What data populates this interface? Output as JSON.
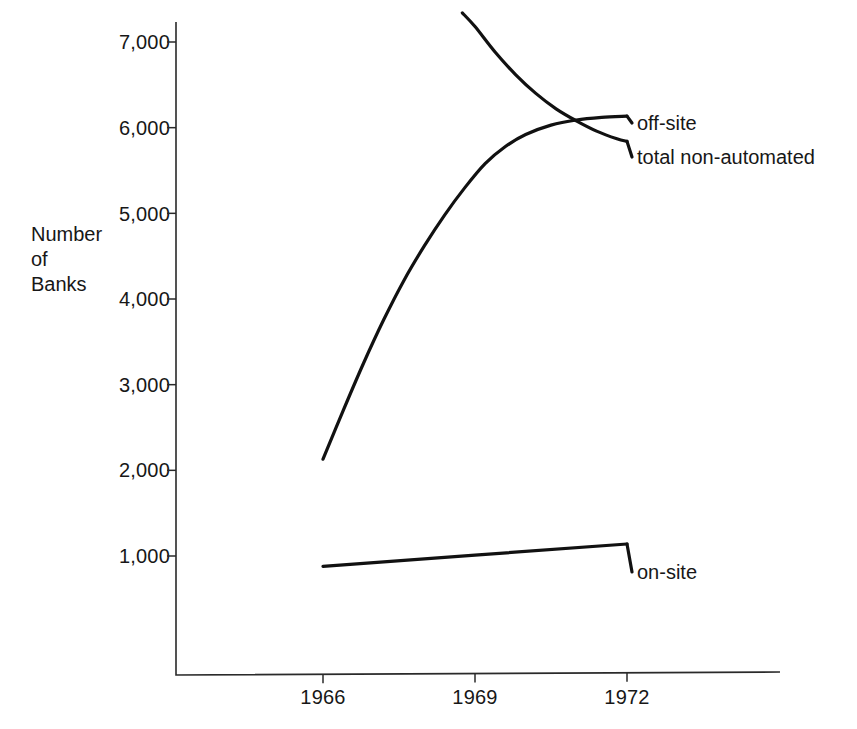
{
  "chart_data": {
    "type": "line",
    "title": "",
    "xlabel": "",
    "ylabel": "Number of Banks",
    "ylabel_lines": [
      "Number",
      "of",
      "Banks"
    ],
    "xlim": [
      1965.5,
      1972.5
    ],
    "ylim": [
      0,
      7400
    ],
    "grid": false,
    "legend_position": "right-of-line-ends",
    "y_ticks": [
      7000,
      6000,
      5000,
      4000,
      3000,
      2000,
      1000
    ],
    "y_tick_labels": [
      "7,000",
      "6,000",
      "5,000",
      "4,000",
      "3,000",
      "2,000",
      "1,000"
    ],
    "x_ticks": [
      1966,
      1969,
      1972
    ],
    "x_tick_labels": [
      "1966",
      "1969",
      "1972"
    ],
    "series": [
      {
        "name": "off-site",
        "label": "off-site",
        "color": "#111111",
        "x": [
          1966.0,
          1966.4,
          1966.8,
          1967.2,
          1967.6,
          1968.0,
          1968.4,
          1968.8,
          1969.2,
          1969.6,
          1970.0,
          1970.5,
          1971.0,
          1971.5,
          1972.0
        ],
        "values": [
          2130,
          2700,
          3250,
          3760,
          4220,
          4620,
          4980,
          5300,
          5580,
          5780,
          5920,
          6030,
          6090,
          6120,
          6135
        ]
      },
      {
        "name": "total non-automated",
        "label": "total non-automated",
        "color": "#111111",
        "x": [
          1968.75,
          1969.0,
          1969.4,
          1969.8,
          1970.2,
          1970.6,
          1971.0,
          1971.4,
          1971.8,
          1972.0
        ],
        "values": [
          7340,
          7180,
          6880,
          6620,
          6400,
          6220,
          6080,
          5960,
          5870,
          5840
        ]
      },
      {
        "name": "on-site",
        "label": "on-site",
        "color": "#111111",
        "x": [
          1966.0,
          1969.0,
          1972.0
        ],
        "values": [
          880,
          1010,
          1140
        ]
      }
    ]
  },
  "axes": {
    "y_axis_name": "y-axis",
    "x_axis_name": "x-axis"
  }
}
